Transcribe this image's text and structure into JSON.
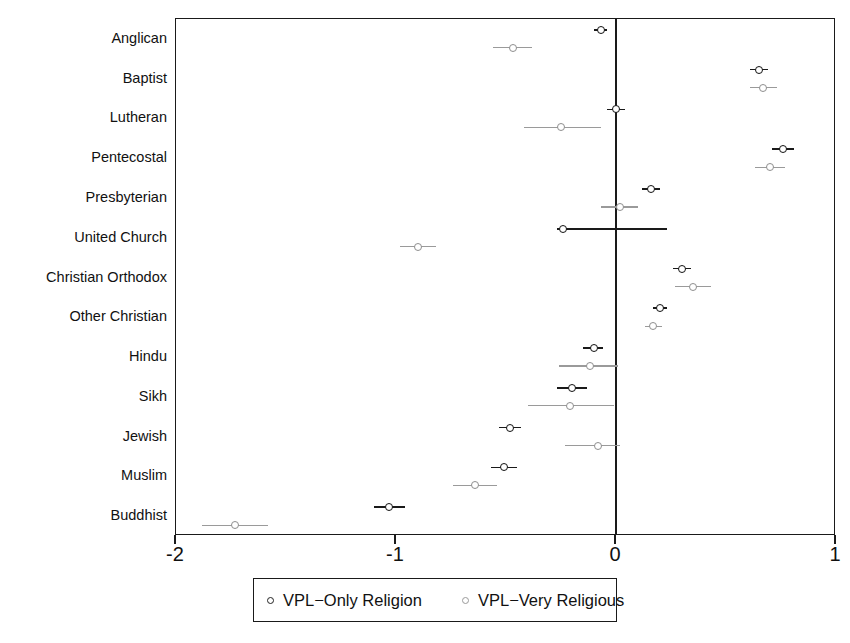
{
  "chart_data": {
    "type": "scatter",
    "title": "",
    "subtitle": "",
    "xlabel": "",
    "ylabel": "",
    "orientation": "horizontal",
    "grid": false,
    "xlim": [
      -2,
      1
    ],
    "xticks": [
      -2,
      -1,
      0,
      1
    ],
    "xtick_labels": [
      "-2",
      "-1",
      "0",
      "1"
    ],
    "reference_line": 0,
    "legend_position": "bottom",
    "categories": [
      "Anglican",
      "Baptist",
      "Lutheran",
      "Pentecostal",
      "Presbyterian",
      "United Church",
      "Christian Orthodox",
      "Other Christian",
      "Hindu",
      "Sikh",
      "Jewish",
      "Muslim",
      "Buddhist"
    ],
    "series": [
      {
        "name": "VPL-Only Religion",
        "color": "#1a1a1a",
        "marker": "open-circle",
        "values": [
          -0.07,
          0.65,
          0.0,
          0.76,
          0.16,
          -0.24,
          0.3,
          0.2,
          -0.1,
          -0.2,
          -0.48,
          -0.51,
          -1.03
        ],
        "ci_low": [
          -0.1,
          0.61,
          -0.04,
          0.71,
          0.12,
          -0.27,
          0.26,
          0.17,
          -0.15,
          -0.27,
          -0.53,
          -0.57,
          -1.1
        ],
        "ci_high": [
          -0.04,
          0.69,
          0.04,
          0.81,
          0.2,
          0.23,
          0.34,
          0.23,
          -0.06,
          -0.13,
          -0.43,
          -0.45,
          -0.96
        ]
      },
      {
        "name": "VPL-Very Religious",
        "color": "#9a9a9a",
        "marker": "open-circle",
        "values": [
          -0.47,
          0.67,
          -0.25,
          0.7,
          0.02,
          -0.9,
          0.35,
          0.17,
          -0.12,
          -0.21,
          -0.08,
          -0.64,
          -1.73
        ],
        "ci_low": [
          -0.56,
          0.61,
          -0.42,
          0.63,
          -0.07,
          -0.98,
          0.27,
          0.13,
          -0.26,
          -0.4,
          -0.23,
          -0.74,
          -1.88
        ],
        "ci_high": [
          -0.38,
          0.73,
          -0.07,
          0.77,
          0.1,
          -0.82,
          0.43,
          0.21,
          0.01,
          -0.01,
          0.02,
          -0.54,
          -1.58
        ]
      }
    ]
  },
  "legend": {
    "entries": [
      {
        "label": "VPL−Only Religion",
        "marker": "open-circle-dark"
      },
      {
        "label": "VPL−Very Religious",
        "marker": "open-circle-light"
      }
    ]
  }
}
